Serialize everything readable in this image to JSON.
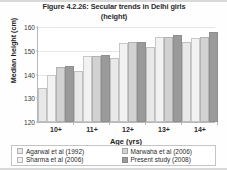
{
  "chart_data": {
    "type": "bar",
    "title": "Figure 4.2.26: Secular trends in Delhi girls (height)",
    "title_line1": "Figure 4.2.26: Secular trends in Delhi girls",
    "title_line2": "(height)",
    "xlabel": "Age (yrs)",
    "ylabel": "Median height (cm)",
    "categories": [
      "10+",
      "11+",
      "12+",
      "13+",
      "14+"
    ],
    "ylim": [
      120,
      160
    ],
    "yticks": [
      120,
      130,
      140,
      150,
      160
    ],
    "grid": true,
    "legend_position": "bottom",
    "series": [
      {
        "name": "Agarwal et al (1992)",
        "color": "#e8e8e8",
        "values": [
          134.5,
          141.5,
          147.0,
          151.5,
          153.5
        ]
      },
      {
        "name": "Sharma et al (2006)",
        "color": "#f2f2f2",
        "values": [
          139.8,
          147.8,
          153.4,
          155.8,
          155.5
        ]
      },
      {
        "name": "Marwaha et al (2006)",
        "color": "#d2d2d2",
        "values": [
          143.0,
          148.0,
          153.5,
          156.0,
          155.6
        ]
      },
      {
        "name": "Present study (2008)",
        "color": "#9a9a9a",
        "values": [
          143.5,
          148.4,
          153.6,
          156.6,
          158.0
        ]
      }
    ]
  },
  "legend": {
    "entries": [
      "Agarwal et al (1992)",
      "Marwaha et al (2006)",
      "Sharma et al (2006)",
      "Present study (2008)"
    ]
  }
}
